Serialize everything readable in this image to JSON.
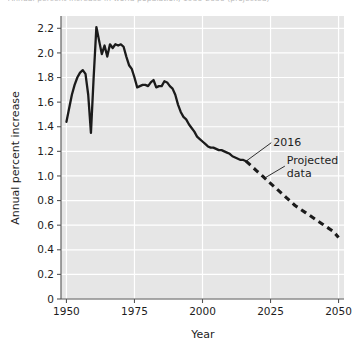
{
  "top_caption": "Annual percent increase in world population, 1950-2050 (projected)",
  "chart_data": {
    "type": "line",
    "title": "",
    "xlabel": "Year",
    "ylabel": "Annual percent increase",
    "xlim": [
      1948,
      2052
    ],
    "ylim": [
      0,
      2.3
    ],
    "xticks": [
      1950,
      1975,
      2000,
      2025,
      2050
    ],
    "xtick_labels": [
      "1950",
      "1975",
      "2000",
      "2025",
      "2050"
    ],
    "yticks": [
      0,
      0.2,
      0.4,
      0.6,
      0.8,
      1.0,
      1.2,
      1.4,
      1.6,
      1.8,
      2.0,
      2.2
    ],
    "ytick_labels": [
      "0",
      "0.2",
      "0.4",
      "0.6",
      "0.8",
      "1.0",
      "1.2",
      "1.4",
      "1.6",
      "1.8",
      "2.0",
      "2.2"
    ],
    "grid": true,
    "grid_color": "#ffffff",
    "plot_background": "#e6e6e6",
    "line_color": "#1b1b1b",
    "legend": "none",
    "series": [
      {
        "name": "Observed data",
        "style": "solid",
        "x": [
          1950,
          1951,
          1952,
          1953,
          1954,
          1955,
          1956,
          1957,
          1958,
          1959,
          1960,
          1961,
          1962,
          1963,
          1964,
          1965,
          1966,
          1967,
          1968,
          1969,
          1970,
          1971,
          1972,
          1973,
          1974,
          1975,
          1976,
          1977,
          1978,
          1979,
          1980,
          1981,
          1982,
          1983,
          1984,
          1985,
          1986,
          1987,
          1988,
          1989,
          1990,
          1991,
          1992,
          1993,
          1994,
          1995,
          1996,
          1997,
          1998,
          1999,
          2000,
          2001,
          2002,
          2003,
          2004,
          2005,
          2006,
          2007,
          2008,
          2009,
          2010,
          2011,
          2012,
          2013,
          2014,
          2015,
          2016
        ],
        "y": [
          1.44,
          1.55,
          1.66,
          1.74,
          1.8,
          1.84,
          1.86,
          1.83,
          1.66,
          1.35,
          1.8,
          2.21,
          2.1,
          1.99,
          2.06,
          1.97,
          2.07,
          2.04,
          2.07,
          2.06,
          2.07,
          2.05,
          1.97,
          1.9,
          1.87,
          1.8,
          1.72,
          1.73,
          1.74,
          1.74,
          1.73,
          1.76,
          1.78,
          1.72,
          1.73,
          1.73,
          1.77,
          1.76,
          1.73,
          1.71,
          1.66,
          1.58,
          1.52,
          1.48,
          1.46,
          1.42,
          1.39,
          1.36,
          1.32,
          1.3,
          1.28,
          1.26,
          1.24,
          1.23,
          1.23,
          1.22,
          1.21,
          1.21,
          1.2,
          1.19,
          1.18,
          1.16,
          1.15,
          1.14,
          1.13,
          1.13,
          1.12
        ]
      },
      {
        "name": "Projected data",
        "style": "dashed",
        "x": [
          2016,
          2018,
          2020,
          2022,
          2024,
          2026,
          2028,
          2030,
          2032,
          2034,
          2036,
          2038,
          2040,
          2042,
          2044,
          2046,
          2048,
          2050
        ],
        "y": [
          1.12,
          1.08,
          1.04,
          1.0,
          0.96,
          0.92,
          0.88,
          0.84,
          0.8,
          0.76,
          0.73,
          0.7,
          0.67,
          0.64,
          0.61,
          0.58,
          0.55,
          0.5
        ]
      }
    ],
    "annotations": [
      {
        "label": "2016",
        "point_x": 2016,
        "point_y": 1.12,
        "text_x": 2026,
        "text_y": 1.27
      },
      {
        "label_line_1": "Projected",
        "label_line_2": "data",
        "point_x": 2023,
        "point_y": 0.985,
        "text_x": 2031,
        "text_y": 1.08
      }
    ]
  }
}
